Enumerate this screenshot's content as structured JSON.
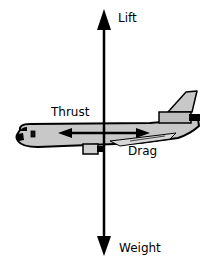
{
  "diagram": {
    "forces": {
      "lift": {
        "label": "Lift",
        "direction": "up"
      },
      "weight": {
        "label": "Weight",
        "direction": "down"
      },
      "thrust": {
        "label": "Thrust",
        "direction": "forward (left)"
      },
      "drag": {
        "label": "Drag",
        "direction": "backward (right)"
      }
    },
    "colors": {
      "ink": "#000000",
      "fuselage_fill": "#c8c8c8",
      "background": "#ffffff"
    },
    "illustration": "airplane-side-view"
  }
}
